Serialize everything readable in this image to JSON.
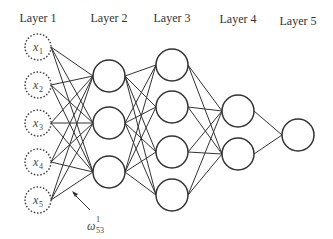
{
  "layers": [
    {
      "label": "Layer 1",
      "x": 38,
      "label_y": 22,
      "nodes": [
        47,
        85,
        123,
        162,
        200
      ],
      "inputs": [
        "x1",
        "x2",
        "x3",
        "x4",
        "x5"
      ],
      "input_base": "x",
      "input_subs": [
        "1",
        "2",
        "3",
        "4",
        "5"
      ]
    },
    {
      "label": "Layer 2",
      "x": 109,
      "label_y": 22,
      "nodes": [
        76,
        123,
        172
      ]
    },
    {
      "label": "Layer 3",
      "x": 172,
      "label_y": 22,
      "nodes": [
        65,
        107,
        152,
        195
      ]
    },
    {
      "label": "Layer 4",
      "x": 238,
      "label_y": 23,
      "nodes": [
        111,
        154
      ]
    },
    {
      "label": "Layer 5",
      "x": 298,
      "label_y": 25,
      "nodes": [
        135
      ]
    }
  ],
  "annotation": {
    "symbol": "ω",
    "superscript": "1",
    "subscript": "53",
    "text": "w^1_53"
  }
}
